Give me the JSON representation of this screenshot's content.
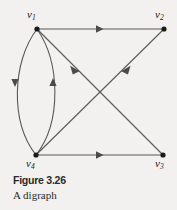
{
  "figure": {
    "caption_title": "Figure 3.26",
    "caption_subtitle": "A digraph",
    "background_color": "#f2f1ef",
    "stroke_color": "#595959",
    "vertex_color": "#1a1a1a"
  },
  "graph": {
    "type": "digraph",
    "vertices": [
      {
        "id": "v1",
        "label": "v",
        "subscript": "1",
        "x": 37,
        "y": 29
      },
      {
        "id": "v2",
        "label": "v",
        "subscript": "2",
        "x": 164,
        "y": 29
      },
      {
        "id": "v3",
        "label": "v",
        "subscript": "3",
        "x": 163,
        "y": 155
      },
      {
        "id": "v4",
        "label": "v",
        "subscript": "4",
        "x": 36,
        "y": 155
      }
    ],
    "edges": [
      {
        "id": "e-v1-v2",
        "from": "v1",
        "to": "v2",
        "shape": "straight",
        "arrow_direction": "right"
      },
      {
        "id": "e-v4-v3",
        "from": "v4",
        "to": "v3",
        "shape": "straight",
        "arrow_direction": "right"
      },
      {
        "id": "e-v1-v3",
        "from": "v1",
        "to": "v3",
        "shape": "straight",
        "arrow_direction": "down-right"
      },
      {
        "id": "e-v2-v4",
        "from": "v2",
        "to": "v4",
        "shape": "straight",
        "arrow_direction": "down-left"
      },
      {
        "id": "e-v1-v4",
        "from": "v1",
        "to": "v4",
        "shape": "curve-left",
        "arrow_direction": "down"
      },
      {
        "id": "e-v4-v1",
        "from": "v4",
        "to": "v1",
        "shape": "curve-right",
        "arrow_direction": "up"
      }
    ]
  }
}
